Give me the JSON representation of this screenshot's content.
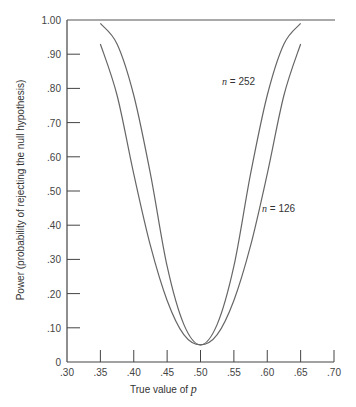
{
  "chart_data": {
    "type": "line",
    "title": "",
    "xlabel": "True value of p",
    "ylabel": "Power (probability of rejecting the null hypothesis)",
    "xlim": [
      0.3,
      0.7
    ],
    "ylim": [
      0,
      1.0
    ],
    "x_ticks": [
      ".30",
      ".35",
      ".40",
      ".45",
      ".50",
      ".55",
      ".60",
      ".65",
      ".70"
    ],
    "y_ticks": [
      "0",
      ".10",
      ".20",
      ".30",
      ".40",
      ".50",
      ".60",
      ".70",
      ".80",
      ".90",
      "1.00"
    ],
    "grid": false,
    "x": [
      0.35,
      0.375,
      0.4,
      0.425,
      0.45,
      0.475,
      0.5,
      0.525,
      0.55,
      0.575,
      0.6,
      0.625,
      0.65
    ],
    "series": [
      {
        "name": "n = 252",
        "values": [
          0.99,
          0.93,
          0.78,
          0.55,
          0.28,
          0.11,
          0.05,
          0.11,
          0.28,
          0.55,
          0.78,
          0.93,
          0.99
        ]
      },
      {
        "name": "n = 126",
        "values": [
          0.93,
          0.78,
          0.55,
          0.34,
          0.18,
          0.08,
          0.05,
          0.08,
          0.18,
          0.34,
          0.55,
          0.78,
          0.93
        ]
      }
    ],
    "annotations": [
      {
        "text": "n = 252",
        "x": 0.545,
        "y": 0.8
      },
      {
        "text": "n = 126",
        "x": 0.58,
        "y": 0.45
      }
    ],
    "reference_line": {
      "y": 1.0
    }
  },
  "labels": {
    "xlabel_prefix": "True value of ",
    "xlabel_var": "p",
    "ylabel": "Power (probability of rejecting the null hypothesis)",
    "n252_var": "n",
    "n252_rest": " =  252",
    "n126_var": "n",
    "n126_rest": " =  126"
  }
}
